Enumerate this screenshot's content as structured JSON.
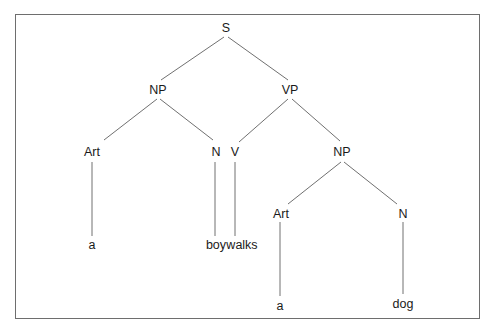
{
  "diagram": {
    "type": "parse-tree",
    "sentence": "a boy walks a dog",
    "line_color": "#707070",
    "border_color": "#6e6e6e",
    "nodes": [
      {
        "id": "s",
        "label": "S",
        "x": 226,
        "y": 28
      },
      {
        "id": "np1",
        "label": "NP",
        "x": 158,
        "y": 90
      },
      {
        "id": "vp",
        "label": "VP",
        "x": 290,
        "y": 90
      },
      {
        "id": "art1",
        "label": "Art",
        "x": 92,
        "y": 152
      },
      {
        "id": "n1",
        "label": "N",
        "x": 216,
        "y": 152
      },
      {
        "id": "v",
        "label": "V",
        "x": 235,
        "y": 152
      },
      {
        "id": "np2",
        "label": "NP",
        "x": 342,
        "y": 152
      },
      {
        "id": "a1",
        "label": "a",
        "x": 92,
        "y": 245
      },
      {
        "id": "boy",
        "label": "boy",
        "x": 216,
        "y": 245
      },
      {
        "id": "walks",
        "label": "walks",
        "x": 242,
        "y": 245
      },
      {
        "id": "art2",
        "label": "Art",
        "x": 281,
        "y": 214
      },
      {
        "id": "n2",
        "label": "N",
        "x": 403,
        "y": 214
      },
      {
        "id": "a2",
        "label": "a",
        "x": 280,
        "y": 306
      },
      {
        "id": "dog",
        "label": "dog",
        "x": 403,
        "y": 304
      }
    ],
    "edges": [
      {
        "from": "s",
        "to": "np1",
        "x1": 224,
        "y1": 37,
        "x2": 161,
        "y2": 80
      },
      {
        "from": "s",
        "to": "vp",
        "x1": 228,
        "y1": 37,
        "x2": 288,
        "y2": 80
      },
      {
        "from": "np1",
        "to": "art1",
        "x1": 157,
        "y1": 99,
        "x2": 104,
        "y2": 140
      },
      {
        "from": "np1",
        "to": "n1",
        "x1": 160,
        "y1": 99,
        "x2": 213,
        "y2": 140
      },
      {
        "from": "vp",
        "to": "v",
        "x1": 288,
        "y1": 99,
        "x2": 239,
        "y2": 142
      },
      {
        "from": "vp",
        "to": "np2",
        "x1": 292,
        "y1": 99,
        "x2": 340,
        "y2": 141
      },
      {
        "from": "art1",
        "to": "a1",
        "x1": 92,
        "y1": 162,
        "x2": 92,
        "y2": 236
      },
      {
        "from": "n1",
        "to": "boy",
        "x1": 215,
        "y1": 162,
        "x2": 215,
        "y2": 236
      },
      {
        "from": "v",
        "to": "walks",
        "x1": 235,
        "y1": 162,
        "x2": 235,
        "y2": 236
      },
      {
        "from": "np2",
        "to": "art2",
        "x1": 341,
        "y1": 162,
        "x2": 288,
        "y2": 204
      },
      {
        "from": "np2",
        "to": "n2",
        "x1": 344,
        "y1": 162,
        "x2": 397,
        "y2": 204
      },
      {
        "from": "art2",
        "to": "a2",
        "x1": 280,
        "y1": 222,
        "x2": 280,
        "y2": 296
      },
      {
        "from": "n2",
        "to": "dog",
        "x1": 403,
        "y1": 222,
        "x2": 403,
        "y2": 294
      }
    ]
  }
}
